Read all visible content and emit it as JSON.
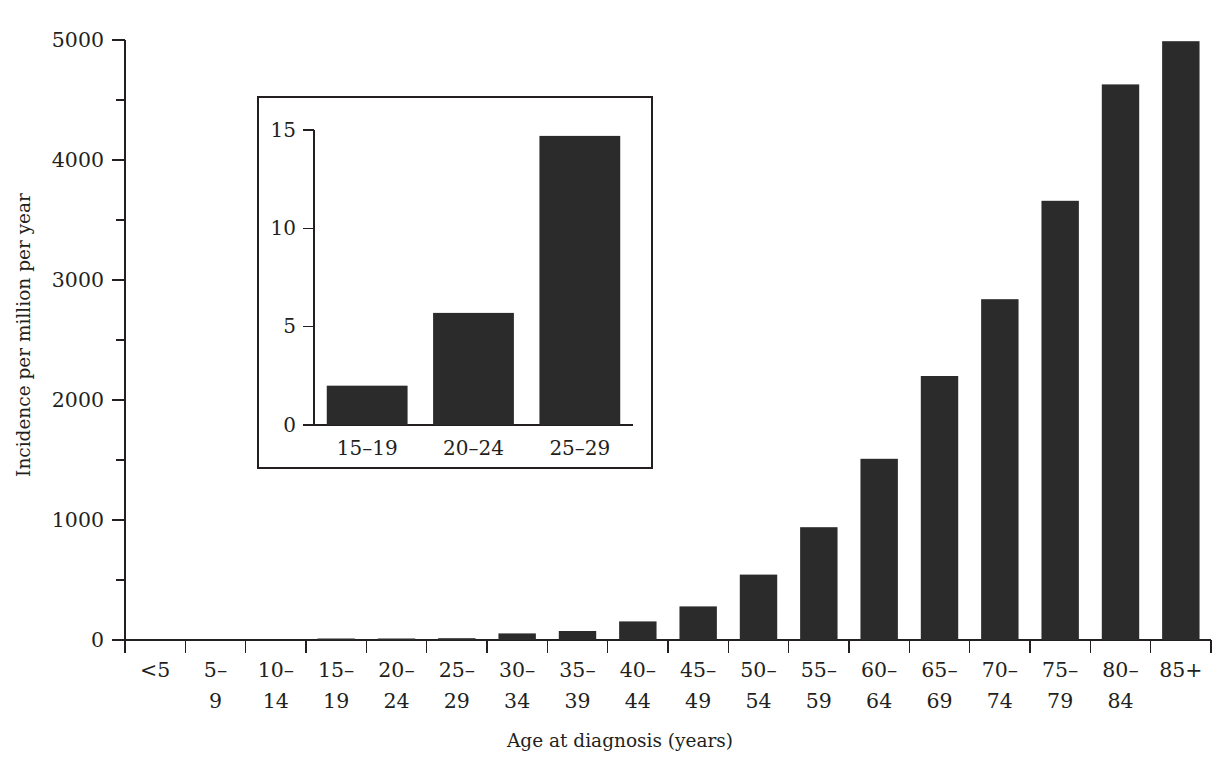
{
  "chart_data": {
    "type": "bar",
    "title": "",
    "subtitle": "",
    "xlabel": "Age at diagnosis (years)",
    "ylabel": "Incidence per million per year",
    "categories": [
      "<5",
      "5–9",
      "10–14",
      "15–19",
      "20–24",
      "25–29",
      "30–34",
      "35–39",
      "40–44",
      "45–49",
      "50–54",
      "55–59",
      "60–64",
      "65–69",
      "70–74",
      "75–79",
      "80–84",
      "85+"
    ],
    "values": [
      0,
      0,
      0,
      2,
      6,
      15,
      55,
      75,
      155,
      280,
      545,
      940,
      1510,
      2200,
      2840,
      3660,
      4630,
      4990
    ],
    "ylim": [
      0,
      5000
    ],
    "yticks": [
      0,
      1000,
      2000,
      3000,
      4000,
      5000
    ],
    "ytick_labels": [
      "0",
      "1000",
      "2000",
      "3000",
      "4000",
      "5000"
    ],
    "yminor_ticks": [
      500,
      1500,
      2500,
      3500,
      4500
    ],
    "grid": false,
    "legend": "none",
    "bar_color": "#2b2b2b",
    "axis_color": "#231f20",
    "inset": {
      "type": "bar",
      "categories": [
        "15–19",
        "20–24",
        "25–29"
      ],
      "values": [
        2.0,
        5.7,
        14.7
      ],
      "ylim": [
        0,
        15
      ],
      "yticks": [
        0,
        5,
        10,
        15
      ],
      "ytick_labels": [
        "0",
        "5",
        "10",
        "15"
      ],
      "xlabel": "",
      "ylabel": "",
      "bar_color": "#2b2b2b",
      "frame_color": "#231f20"
    }
  },
  "figure": {
    "background": "#ffffff"
  }
}
